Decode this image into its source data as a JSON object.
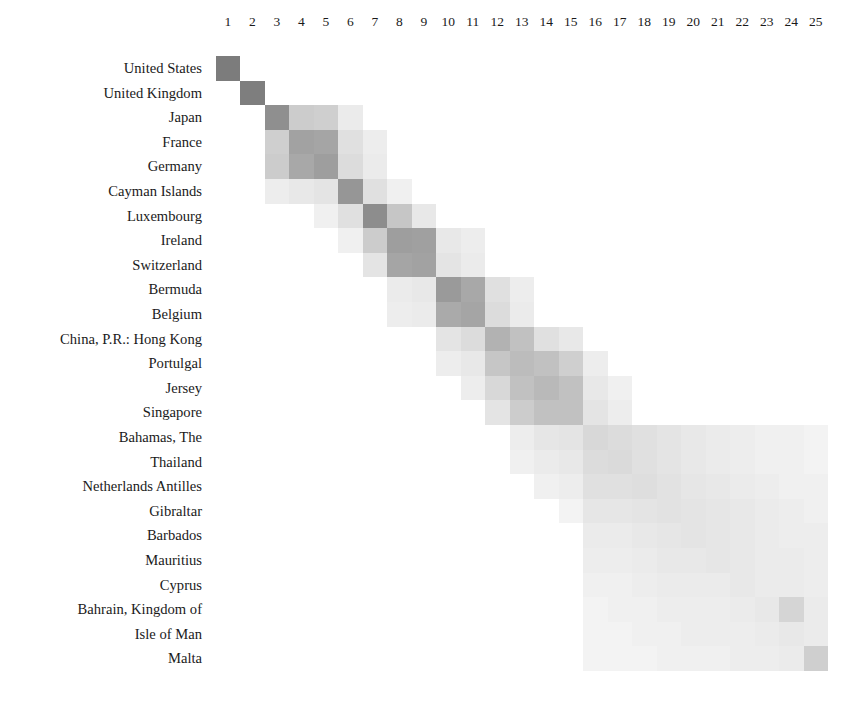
{
  "figure": {
    "kind": "correlation-heatmap-matrix",
    "background_color": "#ffffff",
    "cell_color_dark": "#7c7c7c",
    "cell_color_light": "#fafafa"
  },
  "columns": {
    "labels": [
      "1",
      "2",
      "3",
      "4",
      "5",
      "6",
      "7",
      "8",
      "9",
      "10",
      "11",
      "12",
      "13",
      "14",
      "15",
      "16",
      "17",
      "18",
      "19",
      "20",
      "21",
      "22",
      "23",
      "24",
      "25"
    ]
  },
  "rows": {
    "labels": [
      "United States",
      "United Kingdom",
      "Japan",
      "France",
      "Germany",
      "Cayman Islands",
      "Luxembourg",
      "Ireland",
      "Switzerland",
      "Bermuda",
      "Belgium",
      "China, P.R.: Hong Kong",
      "Portulgal",
      "Jersey",
      "Singapore",
      "Bahamas, The",
      "Thailand",
      "Netherlands Antilles",
      "Gibraltar",
      "Barbados",
      "Mauritius",
      "Cyprus",
      "Bahrain, Kingdom of",
      "Isle of Man",
      "Malta"
    ]
  },
  "chart_data": {
    "type": "heatmap",
    "title": "",
    "xlabel": "",
    "ylabel": "",
    "grid": false,
    "legend": "none",
    "x": [
      "1",
      "2",
      "3",
      "4",
      "5",
      "6",
      "7",
      "8",
      "9",
      "10",
      "11",
      "12",
      "13",
      "14",
      "15",
      "16",
      "17",
      "18",
      "19",
      "20",
      "21",
      "22",
      "23",
      "24",
      "25"
    ],
    "y": [
      "United States",
      "United Kingdom",
      "Japan",
      "France",
      "Germany",
      "Cayman Islands",
      "Luxembourg",
      "Ireland",
      "Switzerland",
      "Bermuda",
      "Belgium",
      "China, P.R.: Hong Kong",
      "Portulgal",
      "Jersey",
      "Singapore",
      "Bahamas, The",
      "Thailand",
      "Netherlands Antilles",
      "Gibraltar",
      "Barbados",
      "Mauritius",
      "Cyprus",
      "Bahrain, Kingdom of",
      "Isle of Man",
      "Malta"
    ],
    "value_range": [
      0,
      1
    ],
    "colormap": "white-to-gray",
    "note": "Block-diagonal clustering structure; intensity falls off sharply away from the diagonal and toward the lower-right of the matrix.",
    "values": [
      [
        1.0,
        0,
        0,
        0,
        0,
        0,
        0,
        0,
        0,
        0,
        0,
        0,
        0,
        0,
        0,
        0,
        0,
        0,
        0,
        0,
        0,
        0,
        0,
        0,
        0
      ],
      [
        0,
        0.97,
        0,
        0,
        0,
        0,
        0,
        0,
        0,
        0,
        0,
        0,
        0,
        0,
        0,
        0,
        0,
        0,
        0,
        0,
        0,
        0,
        0,
        0,
        0
      ],
      [
        0,
        0,
        0.78,
        0.22,
        0.2,
        0.05,
        0,
        0,
        0,
        0,
        0,
        0,
        0,
        0,
        0,
        0,
        0,
        0,
        0,
        0,
        0,
        0,
        0,
        0,
        0
      ],
      [
        0,
        0,
        0.2,
        0.58,
        0.55,
        0.1,
        0.04,
        0,
        0,
        0,
        0,
        0,
        0,
        0,
        0,
        0,
        0,
        0,
        0,
        0,
        0,
        0,
        0,
        0
      ],
      [
        0,
        0,
        0.22,
        0.52,
        0.62,
        0.12,
        0.05,
        0,
        0,
        0,
        0,
        0,
        0,
        0,
        0,
        0,
        0,
        0,
        0,
        0,
        0,
        0,
        0,
        0
      ],
      [
        0,
        0,
        0.04,
        0.06,
        0.08,
        0.7,
        0.1,
        0.03,
        0,
        0,
        0,
        0,
        0,
        0,
        0,
        0,
        0,
        0,
        0,
        0,
        0,
        0,
        0,
        0
      ],
      [
        0,
        0,
        0,
        0,
        0.03,
        0.1,
        0.8,
        0.26,
        0.06,
        0,
        0,
        0,
        0,
        0,
        0,
        0,
        0,
        0,
        0,
        0,
        0,
        0,
        0,
        0,
        0
      ],
      [
        0,
        0,
        0,
        0,
        0,
        0.03,
        0.22,
        0.62,
        0.6,
        0.06,
        0.04,
        0,
        0,
        0,
        0,
        0,
        0,
        0,
        0,
        0,
        0,
        0,
        0,
        0,
        0
      ],
      [
        0,
        0,
        0,
        0,
        0,
        0,
        0.08,
        0.55,
        0.58,
        0.08,
        0.05,
        0,
        0,
        0,
        0,
        0,
        0,
        0,
        0,
        0,
        0,
        0,
        0,
        0,
        0
      ],
      [
        0,
        0,
        0,
        0,
        0,
        0,
        0,
        0.05,
        0.06,
        0.66,
        0.52,
        0.1,
        0.04,
        0,
        0,
        0,
        0,
        0,
        0,
        0,
        0,
        0,
        0,
        0,
        0
      ],
      [
        0,
        0,
        0,
        0,
        0,
        0,
        0,
        0.04,
        0.05,
        0.5,
        0.55,
        0.12,
        0.05,
        0,
        0,
        0,
        0,
        0,
        0,
        0,
        0,
        0,
        0,
        0,
        0
      ],
      [
        0,
        0,
        0,
        0,
        0,
        0,
        0,
        0,
        0,
        0.08,
        0.12,
        0.42,
        0.3,
        0.1,
        0.06,
        0,
        0,
        0,
        0,
        0,
        0,
        0,
        0,
        0,
        0
      ],
      [
        0,
        0,
        0,
        0,
        0,
        0,
        0,
        0,
        0,
        0.04,
        0.06,
        0.26,
        0.34,
        0.3,
        0.2,
        0.04,
        0,
        0,
        0,
        0,
        0,
        0,
        0,
        0,
        0
      ],
      [
        0,
        0,
        0,
        0,
        0,
        0,
        0,
        0,
        0,
        0,
        0.04,
        0.14,
        0.3,
        0.36,
        0.3,
        0.06,
        0.03,
        0,
        0,
        0,
        0,
        0,
        0,
        0,
        0
      ],
      [
        0,
        0,
        0,
        0,
        0,
        0,
        0,
        0,
        0,
        0,
        0,
        0.08,
        0.22,
        0.3,
        0.3,
        0.08,
        0.04,
        0,
        0,
        0,
        0,
        0,
        0,
        0,
        0
      ],
      [
        0,
        0,
        0,
        0,
        0,
        0,
        0,
        0,
        0,
        0,
        0,
        0,
        0.04,
        0.07,
        0.08,
        0.14,
        0.12,
        0.1,
        0.08,
        0.06,
        0.05,
        0.04,
        0.03,
        0.03,
        0.02
      ],
      [
        0,
        0,
        0,
        0,
        0,
        0,
        0,
        0,
        0,
        0,
        0,
        0,
        0.03,
        0.05,
        0.06,
        0.12,
        0.13,
        0.1,
        0.08,
        0.06,
        0.05,
        0.04,
        0.03,
        0.03,
        0.02
      ],
      [
        0,
        0,
        0,
        0,
        0,
        0,
        0,
        0,
        0,
        0,
        0,
        0,
        0,
        0.03,
        0.04,
        0.1,
        0.1,
        0.11,
        0.09,
        0.07,
        0.06,
        0.05,
        0.04,
        0.03,
        0.03
      ],
      [
        0,
        0,
        0,
        0,
        0,
        0,
        0,
        0,
        0,
        0,
        0,
        0,
        0,
        0,
        0.02,
        0.07,
        0.07,
        0.08,
        0.09,
        0.08,
        0.07,
        0.06,
        0.05,
        0.04,
        0.03
      ],
      [
        0,
        0,
        0,
        0,
        0,
        0,
        0,
        0,
        0,
        0,
        0,
        0,
        0,
        0,
        0,
        0.05,
        0.05,
        0.06,
        0.07,
        0.08,
        0.07,
        0.06,
        0.05,
        0.04,
        0.04
      ],
      [
        0,
        0,
        0,
        0,
        0,
        0,
        0,
        0,
        0,
        0,
        0,
        0,
        0,
        0,
        0,
        0.04,
        0.04,
        0.05,
        0.06,
        0.06,
        0.07,
        0.06,
        0.05,
        0.05,
        0.04
      ],
      [
        0,
        0,
        0,
        0,
        0,
        0,
        0,
        0,
        0,
        0,
        0,
        0,
        0,
        0,
        0,
        0.03,
        0.03,
        0.04,
        0.05,
        0.05,
        0.05,
        0.06,
        0.05,
        0.05,
        0.04
      ],
      [
        0,
        0,
        0,
        0,
        0,
        0,
        0,
        0,
        0,
        0,
        0,
        0,
        0,
        0,
        0,
        0.02,
        0.03,
        0.03,
        0.04,
        0.04,
        0.04,
        0.05,
        0.06,
        0.16,
        0.05
      ],
      [
        0,
        0,
        0,
        0,
        0,
        0,
        0,
        0,
        0,
        0,
        0,
        0,
        0,
        0,
        0,
        0.02,
        0.02,
        0.03,
        0.03,
        0.04,
        0.04,
        0.04,
        0.05,
        0.06,
        0.05
      ],
      [
        0,
        0,
        0,
        0,
        0,
        0,
        0,
        0,
        0,
        0,
        0,
        0,
        0,
        0,
        0,
        0.02,
        0.02,
        0.02,
        0.03,
        0.03,
        0.03,
        0.04,
        0.04,
        0.05,
        0.2
      ]
    ]
  }
}
